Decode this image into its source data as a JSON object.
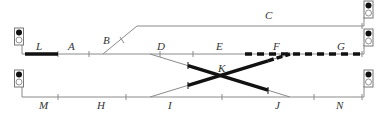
{
  "diagram": {
    "colors": {
      "track": "#888888",
      "occupied": "#111111",
      "route": "#111111",
      "signal_frame": "#777777",
      "signal_red": "#111111",
      "signal_off": "#ffffff"
    },
    "sections": {
      "L": "L",
      "A": "A",
      "B": "B",
      "C": "C",
      "D": "D",
      "E": "E",
      "F": "F",
      "G": "G",
      "K": "K",
      "M": "M",
      "H": "H",
      "I": "I",
      "J": "J",
      "N": "N"
    },
    "signals": [
      {
        "id": "signal-left-upper",
        "aspect": "red"
      },
      {
        "id": "signal-left-lower",
        "aspect": "red"
      },
      {
        "id": "signal-right-top",
        "aspect": "red"
      },
      {
        "id": "signal-right-middle",
        "aspect": "red"
      },
      {
        "id": "signal-right-lower",
        "aspect": "red"
      }
    ],
    "states": {
      "occupied_sections": [
        "L",
        "K"
      ],
      "route_set": [
        "F",
        "G"
      ]
    }
  }
}
